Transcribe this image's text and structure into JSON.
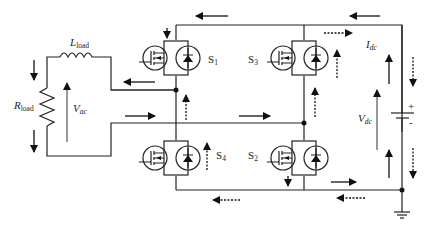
{
  "diagram": {
    "type": "H-bridge inverter circuit",
    "components": {
      "inductor": {
        "symbol": "L",
        "subscript": "load"
      },
      "resistor": {
        "symbol": "R",
        "subscript": "load"
      },
      "ac_voltage": {
        "symbol": "V",
        "subscript": "ac"
      },
      "dc_voltage": {
        "symbol": "V",
        "subscript": "dc"
      },
      "dc_current": {
        "symbol": "I",
        "subscript": "dc"
      },
      "battery_plus": "+",
      "battery_minus": "-",
      "switches": [
        {
          "id": "S1",
          "symbol": "S",
          "subscript": "1"
        },
        {
          "id": "S2",
          "symbol": "S",
          "subscript": "2"
        },
        {
          "id": "S3",
          "symbol": "S",
          "subscript": "3"
        },
        {
          "id": "S4",
          "symbol": "S",
          "subscript": "4"
        }
      ]
    },
    "arrow_legend": {
      "solid": "current path (mode 1)",
      "dashed": "current path (mode 2)"
    }
  }
}
